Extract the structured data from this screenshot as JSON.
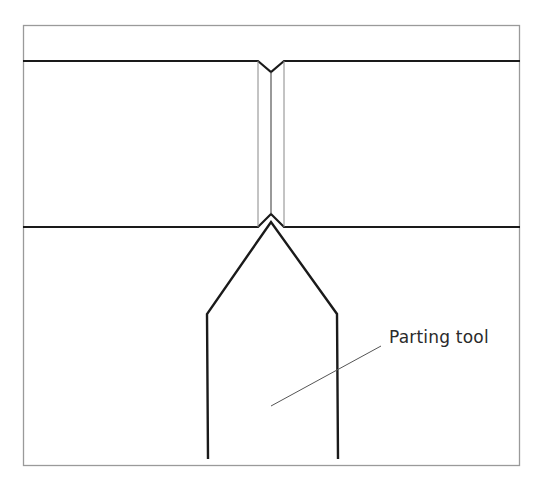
{
  "diagram": {
    "colors": {
      "background": "#ffffff",
      "frame": "#9a9a9a",
      "outline": "#1a1a1a",
      "thin_line": "#777777",
      "leader": "#555555",
      "text": "#2a2a2a"
    },
    "frame": {
      "x": 23,
      "y": 25,
      "width": 497,
      "height": 441
    },
    "workpiece": {
      "top_edge_y": 61,
      "bottom_edge_y": 227,
      "left_x": 23,
      "right_x": 520,
      "groove": {
        "left_x": 258,
        "center_x": 271,
        "right_x": 284,
        "top_notch_depth_y": 72,
        "bottom_notch_apex_y": 214
      }
    },
    "tool": {
      "tip": {
        "x": 271,
        "y": 222
      },
      "left_shoulder": {
        "x": 207,
        "y": 314
      },
      "right_shoulder": {
        "x": 337,
        "y": 314
      },
      "bottom_y": 459
    },
    "labels": [
      {
        "id": "parting-tool-label",
        "text": "Parting tool",
        "x": 389,
        "y": 327,
        "leader": {
          "x1": 381,
          "y1": 346,
          "x2": 271,
          "y2": 406
        }
      }
    ]
  }
}
